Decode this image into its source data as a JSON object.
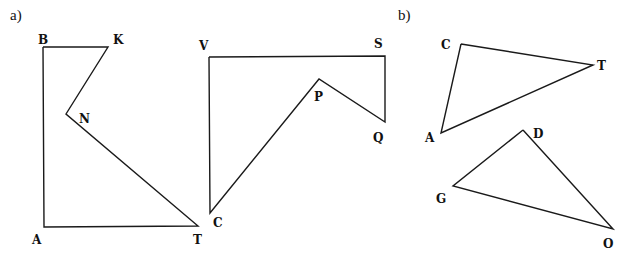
{
  "parts": [
    {
      "label": "a)",
      "x": 10,
      "y": 20
    },
    {
      "label": "b)",
      "x": 398,
      "y": 20
    }
  ],
  "shapes": [
    {
      "name": "polygon-BKNTA",
      "points": [
        [
          43,
          47
        ],
        [
          108,
          47
        ],
        [
          66,
          114
        ],
        [
          198,
          226
        ],
        [
          44,
          227
        ]
      ],
      "vertices": [
        {
          "label": "B",
          "x": 38,
          "y": 44
        },
        {
          "label": "K",
          "x": 113,
          "y": 44
        },
        {
          "label": "N",
          "x": 79,
          "y": 123
        },
        {
          "label": "T",
          "x": 193,
          "y": 244
        },
        {
          "label": "A",
          "x": 32,
          "y": 244
        }
      ]
    },
    {
      "name": "polygon-VSQPC",
      "points": [
        [
          209,
          57
        ],
        [
          385,
          56
        ],
        [
          385,
          122
        ],
        [
          319,
          79
        ],
        [
          210,
          213
        ]
      ],
      "vertices": [
        {
          "label": "V",
          "x": 199,
          "y": 50
        },
        {
          "label": "S",
          "x": 374,
          "y": 48
        },
        {
          "label": "Q",
          "x": 373,
          "y": 142
        },
        {
          "label": "P",
          "x": 314,
          "y": 101
        },
        {
          "label": "C",
          "x": 213,
          "y": 227
        }
      ]
    },
    {
      "name": "triangle-CTA",
      "points": [
        [
          461,
          44
        ],
        [
          593,
          65
        ],
        [
          441,
          133
        ]
      ],
      "vertices": [
        {
          "label": "C",
          "x": 441,
          "y": 49
        },
        {
          "label": "T",
          "x": 597,
          "y": 70
        },
        {
          "label": "A",
          "x": 425,
          "y": 142
        }
      ]
    },
    {
      "name": "triangle-DGO",
      "points": [
        [
          523,
          130
        ],
        [
          453,
          186
        ],
        [
          613,
          229
        ]
      ],
      "vertices": [
        {
          "label": "D",
          "x": 533,
          "y": 138
        },
        {
          "label": "G",
          "x": 436,
          "y": 203
        },
        {
          "label": "O",
          "x": 603,
          "y": 248
        }
      ]
    }
  ],
  "colors": {
    "stroke": "#1a1a1a",
    "text": "#111111",
    "background": "#ffffff"
  }
}
